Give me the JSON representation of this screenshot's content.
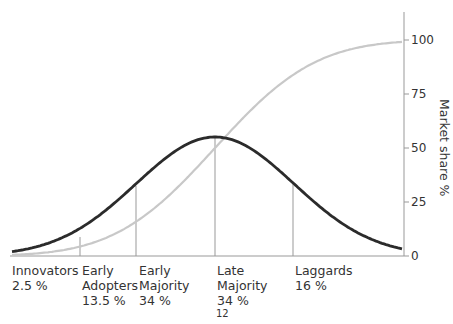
{
  "chart_data": {
    "type": "line",
    "title": "",
    "xlabel": "",
    "ylabel": "Market share %",
    "ylim": [
      0,
      100
    ],
    "yticks": [
      0,
      25,
      50,
      75,
      100
    ],
    "grid": false,
    "series": [
      {
        "name": "Adoption (bell curve)",
        "color": "#2b2b2b",
        "shape": "normal distribution",
        "peak_x": "mean (Late Majority start)",
        "peak_y_pct": 54
      },
      {
        "name": "Market share (cumulative S-curve)",
        "color": "#c8c8c8",
        "shape": "cumulative",
        "y_start": 0,
        "y_end": 100
      }
    ],
    "categories": [
      {
        "name": "Innovators",
        "share": "2.5 %"
      },
      {
        "name": "Early Adopters",
        "share": "13.5 %"
      },
      {
        "name": "Early Majority",
        "share": "34 %"
      },
      {
        "name": "Late Majority",
        "share": "34 %"
      },
      {
        "name": "Laggards",
        "share": "16 %"
      }
    ]
  },
  "labels": {
    "innovators": "Innovators\n2.5 %",
    "early_adopters": "Early\nAdopters\n13.5 %",
    "early_majority": "Early\nMajority\n34 %",
    "late_majority": "Late\nMajority\n34 %",
    "laggards": "Laggards\n16 %"
  },
  "ticks": {
    "t0": "0",
    "t25": "25",
    "t50": "50",
    "t75": "75",
    "t100": "100"
  },
  "ylabel": "Market share %",
  "page_number": "12"
}
